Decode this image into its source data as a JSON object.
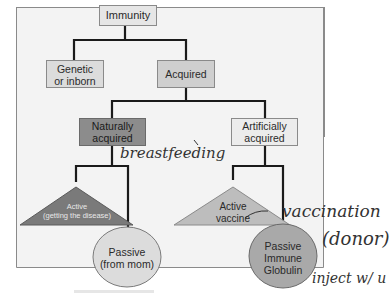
{
  "diagram": {
    "type": "tree",
    "nodes": {
      "root": {
        "label": "Immunity"
      },
      "genetic": {
        "label_line1": "Genetic",
        "label_line2": "or inborn"
      },
      "acquired": {
        "label": "Acquired"
      },
      "natural": {
        "label_line1": "Naturally",
        "label_line2": "acquired"
      },
      "artificial": {
        "label_line1": "Artificially",
        "label_line2": "acquired"
      },
      "nat_active": {
        "label_line1": "Active",
        "label_line2": "(getting the disease)"
      },
      "nat_passive": {
        "label_line1": "Passive",
        "label_line2": "(from mom)"
      },
      "art_active": {
        "label_line1": "Active",
        "label_line2": "vaccine"
      },
      "art_passive": {
        "label_line1": "Passive",
        "label_line2": "Immune",
        "label_line3": "Globulin"
      }
    },
    "annotations": {
      "breastfeeding": "breastfeeding",
      "vaccination": "vaccination",
      "donor": "(donor)",
      "inject": "inject w/ u"
    },
    "colors": {
      "frame_bg": "#f3f3f3",
      "box_light": "#e6e6e6",
      "box_mid": "#cfcfcf",
      "box_dark": "#8c8c8c",
      "triangle_dark": "#7a7a7a",
      "triangle_light": "#bdbdbd",
      "ellipse_light": "#dcdcdc",
      "ellipse_mid": "#a9a9a9",
      "line": "#1a1a1a"
    }
  }
}
